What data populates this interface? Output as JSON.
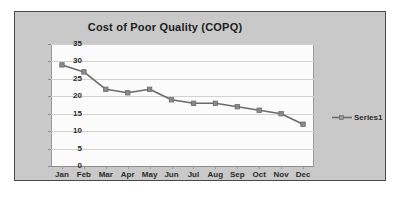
{
  "chart_data": {
    "type": "line",
    "title": "Cost of Poor Quality (COPQ)",
    "xlabel": "",
    "ylabel": "",
    "categories": [
      "Jan",
      "Feb",
      "Mar",
      "Apr",
      "May",
      "Jun",
      "Jul",
      "Aug",
      "Sep",
      "Oct",
      "Nov",
      "Dec"
    ],
    "series": [
      {
        "name": "Series1",
        "values": [
          29,
          27,
          22,
          21,
          22,
          19,
          18,
          18,
          17,
          16,
          15,
          12
        ]
      }
    ],
    "ylim": [
      0,
      35
    ],
    "y_ticks": [
      0,
      5,
      10,
      15,
      20,
      25,
      30,
      35
    ],
    "y_tick_labels": [
      "0",
      "5",
      "10",
      "15",
      "20",
      "25",
      "30",
      "35"
    ],
    "grid": true,
    "grid_axis": "y",
    "legend": [
      "Series1"
    ],
    "legend_position": "right",
    "colors": {
      "line": "#6b6b6b",
      "marker": "#8a8a8a",
      "plot_background": "#fbfbfb",
      "chart_background": "#c9c9c9",
      "border": "#4a4a4a",
      "gridline": "#d2d2d2",
      "text": "#2b2b2b",
      "title_text": "#1d1d1d"
    }
  }
}
